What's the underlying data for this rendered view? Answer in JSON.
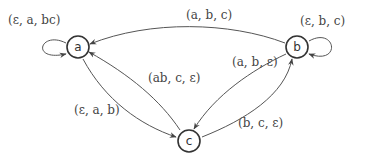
{
  "diagram": {
    "type": "pushdown-automaton-state-graph",
    "nodes": [
      {
        "id": "a",
        "label": "a"
      },
      {
        "id": "b",
        "label": "b"
      },
      {
        "id": "c",
        "label": "c"
      }
    ],
    "edges": [
      {
        "from": "a",
        "to": "a",
        "label": "(ε, a, bc)"
      },
      {
        "from": "b",
        "to": "b",
        "label": "(ε, b, c)"
      },
      {
        "from": "b",
        "to": "a",
        "label": "(a, b, c)"
      },
      {
        "from": "a",
        "to": "c",
        "label": "(ε, a, b)"
      },
      {
        "from": "c",
        "to": "a",
        "label": "(ab, c, ε)"
      },
      {
        "from": "b",
        "to": "c",
        "label": "(a, b, ε)"
      },
      {
        "from": "c",
        "to": "b",
        "label": "(b, c, ε)"
      }
    ],
    "colors": {
      "stroke": "#333333",
      "edge": "#555555",
      "text": "#444444",
      "background": "#ffffff"
    }
  }
}
